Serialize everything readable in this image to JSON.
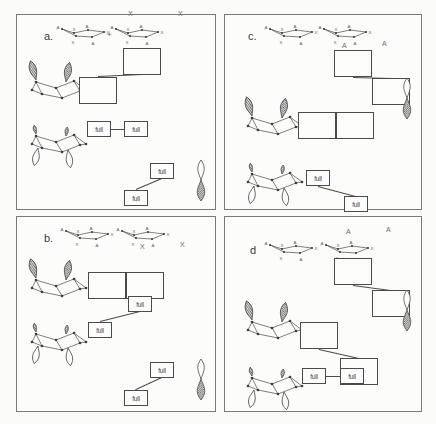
{
  "figure": {
    "type": "orbital-interaction-diagram",
    "background": "#fbfbfa",
    "line_color": "#4a4a4a",
    "border_color": "#7a7a7a",
    "panel_count": 4,
    "occupancy_label": "full",
    "empty_label": ""
  },
  "panels": [
    {
      "id": "a",
      "label": "a.",
      "markers": [
        {
          "text": "X",
          "x": 128,
          "y": 10
        },
        {
          "text": "X",
          "x": 178,
          "y": 10
        }
      ],
      "rings": [
        {
          "name": "ring-left",
          "x": 58,
          "y": 22,
          "vertex_labels": [
            "A",
            "X",
            "A",
            "X",
            "A",
            "X"
          ]
        },
        {
          "name": "ring-right",
          "x": 112,
          "y": 22,
          "vertex_labels": [
            "A",
            "X",
            "A",
            "X",
            "A",
            "X"
          ]
        }
      ],
      "ring_plus": "+",
      "fragments": [
        {
          "name": "cage-upper",
          "x": 22,
          "y": 60,
          "lobes": "up-shaded"
        },
        {
          "name": "cage-lower",
          "x": 22,
          "y": 114,
          "lobes": "down-open"
        }
      ],
      "levels": [
        {
          "name": "level-1",
          "size": "big",
          "x": 123,
          "y": 48,
          "occupancy": ""
        },
        {
          "name": "level-2",
          "size": "big",
          "x": 79,
          "y": 77,
          "occupancy": ""
        },
        {
          "name": "level-3",
          "size": "sm",
          "x": 87,
          "y": 121,
          "occupancy": "full"
        },
        {
          "name": "level-4",
          "size": "sm",
          "x": 124,
          "y": 121,
          "occupancy": "full"
        },
        {
          "name": "level-5",
          "size": "sm",
          "x": 150,
          "y": 163,
          "occupancy": "full"
        },
        {
          "name": "level-6",
          "size": "sm",
          "x": 124,
          "y": 190,
          "occupancy": "full"
        }
      ],
      "connectors": [
        {
          "name": "conn-diag-top",
          "x1": 123,
          "y1": 68,
          "x2": 99,
          "y2": 84
        },
        {
          "name": "conn-horiz-mid",
          "x1": 111,
          "y1": 129,
          "x2": 124,
          "y2": 129
        },
        {
          "name": "conn-diag-bot",
          "x1": 150,
          "y1": 175,
          "x2": 136,
          "y2": 190
        }
      ],
      "p_orbital": {
        "name": "p-orbital",
        "x": 190,
        "y": 158,
        "top": "open",
        "bottom": "shaded"
      }
    },
    {
      "id": "b",
      "label": "b.",
      "markers": [
        {
          "text": "X",
          "x": 140,
          "y": 243
        },
        {
          "text": "X",
          "x": 180,
          "y": 241
        }
      ],
      "rings": [
        {
          "name": "ring-left",
          "x": 62,
          "y": 224,
          "vertex_labels": [
            "A",
            "X",
            "A",
            "X",
            "A",
            "X"
          ]
        },
        {
          "name": "ring-right",
          "x": 118,
          "y": 224,
          "vertex_labels": [
            "A",
            "X",
            "A",
            "X",
            "A",
            "X"
          ]
        }
      ],
      "ring_plus": "",
      "fragments": [
        {
          "name": "cage-upper",
          "x": 22,
          "y": 258,
          "lobes": "up-shaded"
        },
        {
          "name": "cage-lower",
          "x": 22,
          "y": 312,
          "lobes": "down-open"
        }
      ],
      "levels": [
        {
          "name": "level-1",
          "size": "big",
          "x": 88,
          "y": 272,
          "occupancy": ""
        },
        {
          "name": "level-2",
          "size": "big",
          "x": 126,
          "y": 272,
          "occupancy": ""
        },
        {
          "name": "level-3",
          "size": "sm",
          "x": 128,
          "y": 296,
          "occupancy": "full"
        },
        {
          "name": "level-4",
          "size": "sm",
          "x": 88,
          "y": 322,
          "occupancy": "full"
        },
        {
          "name": "level-5",
          "size": "sm",
          "x": 150,
          "y": 362,
          "occupancy": "full"
        },
        {
          "name": "level-6",
          "size": "sm",
          "x": 124,
          "y": 390,
          "occupancy": "full"
        }
      ],
      "connectors": [
        {
          "name": "conn-horiz-top",
          "x1": 126,
          "y1": 286,
          "x2": 126,
          "y2": 286
        },
        {
          "name": "conn-diag-mid",
          "x1": 128,
          "y1": 308,
          "x2": 112,
          "y2": 322
        },
        {
          "name": "conn-diag-bot",
          "x1": 150,
          "y1": 374,
          "x2": 136,
          "y2": 390
        }
      ],
      "p_orbital": {
        "name": "p-orbital",
        "x": 190,
        "y": 357,
        "top": "open",
        "bottom": "shaded"
      }
    },
    {
      "id": "c",
      "label": "c.",
      "markers": [
        {
          "text": "A",
          "x": 342,
          "y": 42
        },
        {
          "text": "A",
          "x": 382,
          "y": 40
        }
      ],
      "rings": [
        {
          "name": "ring-left",
          "x": 266,
          "y": 22,
          "vertex_labels": [
            "A",
            "X",
            "A",
            "X",
            "A",
            "X"
          ]
        },
        {
          "name": "ring-right",
          "x": 320,
          "y": 22,
          "vertex_labels": [
            "A",
            "X",
            "A",
            "X",
            "A",
            "X"
          ]
        }
      ],
      "ring_plus": "",
      "fragments": [
        {
          "name": "cage-upper",
          "x": 238,
          "y": 96,
          "lobes": "up-shaded"
        },
        {
          "name": "cage-lower",
          "x": 238,
          "y": 152,
          "lobes": "down-open"
        }
      ],
      "levels": [
        {
          "name": "level-1",
          "size": "big",
          "x": 334,
          "y": 50,
          "occupancy": ""
        },
        {
          "name": "level-2",
          "size": "big",
          "x": 372,
          "y": 78,
          "occupancy": ""
        },
        {
          "name": "level-3",
          "size": "big",
          "x": 298,
          "y": 112,
          "occupancy": ""
        },
        {
          "name": "level-4",
          "size": "big",
          "x": 336,
          "y": 112,
          "occupancy": ""
        },
        {
          "name": "level-5",
          "size": "sm",
          "x": 306,
          "y": 170,
          "occupancy": "full"
        },
        {
          "name": "level-6",
          "size": "sm",
          "x": 344,
          "y": 196,
          "occupancy": "full"
        }
      ],
      "connectors": [
        {
          "name": "conn-diag-top",
          "x1": 352,
          "y1": 72,
          "x2": 376,
          "y2": 86
        },
        {
          "name": "conn-horiz-mid",
          "x1": 336,
          "y1": 126,
          "x2": 336,
          "y2": 126
        },
        {
          "name": "conn-diag-bot",
          "x1": 330,
          "y1": 180,
          "x2": 346,
          "y2": 196
        }
      ],
      "p_orbital": {
        "name": "p-orbital",
        "x": 396,
        "y": 76,
        "top": "open",
        "bottom": "shaded"
      }
    },
    {
      "id": "d",
      "label": "d",
      "markers": [
        {
          "text": "A",
          "x": 346,
          "y": 228
        },
        {
          "text": "A",
          "x": 386,
          "y": 226
        }
      ],
      "rings": [
        {
          "name": "ring-left",
          "x": 266,
          "y": 238,
          "vertex_labels": [
            "A",
            "X",
            "A",
            "X",
            "A",
            "X"
          ]
        },
        {
          "name": "ring-right",
          "x": 322,
          "y": 238,
          "vertex_labels": [
            "A",
            "X",
            "A",
            "X",
            "A",
            "X"
          ]
        }
      ],
      "ring_plus": "",
      "fragments": [
        {
          "name": "cage-upper",
          "x": 238,
          "y": 300,
          "lobes": "up-shaded"
        },
        {
          "name": "cage-lower",
          "x": 238,
          "y": 356,
          "lobes": "down-open"
        }
      ],
      "levels": [
        {
          "name": "level-1",
          "size": "big",
          "x": 334,
          "y": 258,
          "occupancy": ""
        },
        {
          "name": "level-2",
          "size": "big",
          "x": 372,
          "y": 290,
          "occupancy": ""
        },
        {
          "name": "level-3",
          "size": "big",
          "x": 300,
          "y": 322,
          "occupancy": ""
        },
        {
          "name": "level-4",
          "size": "big",
          "x": 340,
          "y": 358,
          "occupancy": ""
        },
        {
          "name": "level-5",
          "size": "sm",
          "x": 302,
          "y": 368,
          "occupancy": "full"
        },
        {
          "name": "level-6",
          "size": "sm",
          "x": 340,
          "y": 368,
          "occupancy": "full"
        }
      ],
      "connectors": [
        {
          "name": "conn-diag-top",
          "x1": 352,
          "y1": 280,
          "x2": 376,
          "y2": 296
        },
        {
          "name": "conn-diag-mid",
          "x1": 318,
          "y1": 342,
          "x2": 344,
          "y2": 362
        },
        {
          "name": "conn-horiz-bot",
          "x1": 326,
          "y1": 376,
          "x2": 340,
          "y2": 376
        }
      ],
      "p_orbital": {
        "name": "p-orbital",
        "x": 396,
        "y": 288,
        "top": "open",
        "bottom": "shaded"
      }
    }
  ]
}
